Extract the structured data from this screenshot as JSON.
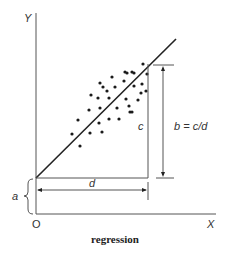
{
  "diagram": {
    "caption": "regression",
    "axes": {
      "y_label": "Y",
      "x_label": "X",
      "origin_label": "O"
    },
    "labels": {
      "intercept": "a",
      "run": "d",
      "rise": "c",
      "slope_formula": "b = c/d"
    },
    "colors": {
      "ink": "#222222",
      "axis": "#555555"
    }
  },
  "chart_data": {
    "type": "scatter",
    "title": "regression",
    "xlabel": "X",
    "ylabel": "Y",
    "note": "Schematic scatter with fitted regression line Y = a + bX; positions in arbitrary units relative to origin O",
    "regression_line": {
      "intercept_label": "a",
      "slope_label": "b = c/d"
    },
    "points": [
      [
        36,
        80
      ],
      [
        44,
        68
      ],
      [
        42,
        94
      ],
      [
        53,
        104
      ],
      [
        54,
        81
      ],
      [
        55,
        119
      ],
      [
        62,
        116
      ],
      [
        64,
        131
      ],
      [
        67,
        127
      ],
      [
        71,
        123
      ],
      [
        76,
        137
      ],
      [
        64,
        106
      ],
      [
        63,
        91
      ],
      [
        66,
        82
      ],
      [
        73,
        116
      ],
      [
        73,
        95
      ],
      [
        79,
        127
      ],
      [
        81,
        106
      ],
      [
        83,
        95
      ],
      [
        88,
        133
      ],
      [
        89,
        142
      ],
      [
        90,
        115
      ],
      [
        91,
        141
      ],
      [
        93,
        108
      ],
      [
        94,
        102
      ],
      [
        96,
        142
      ],
      [
        98,
        141
      ],
      [
        96,
        102
      ],
      [
        98,
        128
      ],
      [
        102,
        114
      ],
      [
        105,
        121
      ],
      [
        106,
        130
      ],
      [
        107,
        150
      ],
      [
        110,
        123
      ],
      [
        111,
        140
      ]
    ]
  }
}
